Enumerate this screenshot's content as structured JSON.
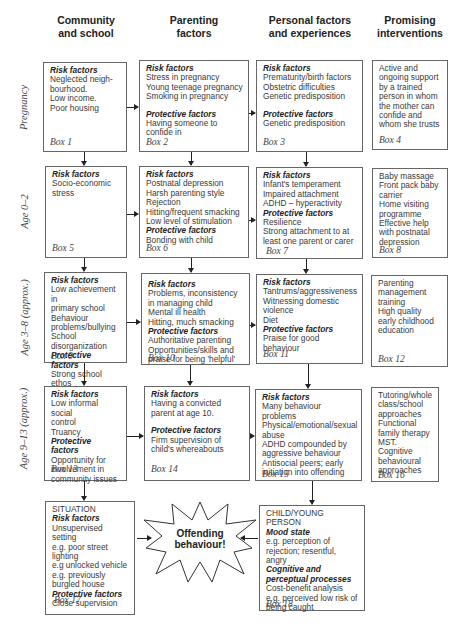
{
  "columns": [
    {
      "title_line1": "Community",
      "title_line2": "and school"
    },
    {
      "title_line1": "Parenting",
      "title_line2": "factors"
    },
    {
      "title_line1": "Personal factors",
      "title_line2": "and experiences"
    },
    {
      "title_line1": "Promising",
      "title_line2": "interventions"
    }
  ],
  "rows": [
    {
      "label": "Pregnancy"
    },
    {
      "label": "Age 0–2"
    },
    {
      "label": "Age 3–8 (approx.)"
    },
    {
      "label": "Age 9–13 (approx.)"
    }
  ],
  "headings": {
    "risk": "Risk factors",
    "protective": "Protective factors"
  },
  "boxes": {
    "b1": {
      "risk": [
        "Neglected neigh-",
        "bourhood.",
        "Low income.",
        "Poor housing"
      ],
      "label": "Box 1"
    },
    "b2": {
      "risk": [
        "Stress in pregnancy",
        "Young teenage pregnancy",
        "Smoking in pregnancy"
      ],
      "protective": [
        "Having someone to",
        "confide in"
      ],
      "label": "Box 2"
    },
    "b3": {
      "risk": [
        "Prematurity/birth factors",
        "Obstetric difficulties",
        "Genetic predisposition"
      ],
      "protective": [
        "Genetic predisposition"
      ],
      "label": "Box 3"
    },
    "b4": {
      "text": [
        "Active and",
        "ongoing support",
        "by a trained",
        "person in whom",
        "the mother can",
        "confide and",
        "whom she trusts"
      ],
      "label": "Box 4"
    },
    "b5": {
      "risk": [
        "Socio-economic",
        "stress"
      ],
      "label": "Box 5"
    },
    "b6": {
      "risk": [
        "Postnatal depression",
        "Harsh parenting style",
        "Rejection",
        "Hitting/frequent smacking",
        "Low level of stimulation"
      ],
      "protective": [
        "Bonding with child"
      ],
      "label": "Box 6"
    },
    "b7": {
      "risk": [
        "Infant's temperament",
        "Impaired attachment",
        "ADHD – hyperactivity"
      ],
      "protective": [
        "Resilience",
        "Strong attachment to at",
        "least one parent or carer"
      ],
      "label": "Box 7"
    },
    "b8": {
      "text": [
        "Baby massage",
        "Front pack baby",
        "carrier",
        "Home visiting",
        "programme",
        "Effective help",
        "with postnatal",
        "depression"
      ],
      "label": "Box 8"
    },
    "b9": {
      "risk": [
        "Low achievement in",
        "primary school",
        "Behaviour",
        "problems/bullying",
        "School",
        "disorganization"
      ],
      "protective": [
        "Strong school ethos"
      ],
      "label": "Box 9"
    },
    "b10": {
      "risk": [
        "Problems, inconsistency",
        "in managing child",
        "Mental ill health",
        "Hitting, much smacking"
      ],
      "protective": [
        "Authoritative parenting",
        "Opportunities/skills and",
        "praise for being 'helpful'"
      ],
      "label": "Box 10"
    },
    "b11": {
      "risk": [
        "Tantrums/aggressiveness",
        "Witnessing domestic",
        "violence",
        "Diet"
      ],
      "protective": [
        "Praise for good behaviour"
      ],
      "label": "Box 11"
    },
    "b12": {
      "text": [
        "Parenting",
        "management",
        "training",
        "High quality",
        "early childhood",
        "education"
      ],
      "label": "Box 12"
    },
    "b13": {
      "risk": [
        "Low informal social",
        "control",
        "Truancy"
      ],
      "protective": [
        "Opportunity for",
        "involvement in",
        "community issues"
      ],
      "label": "Box 13"
    },
    "b14": {
      "risk": [
        "Having a convicted",
        "parent at age 10."
      ],
      "protective": [
        "Firm supervision of",
        "child's whereabouts"
      ],
      "label": "Box 14"
    },
    "b15": {
      "risk": [
        "Many behaviour problems",
        "Physical/emotional/sexual",
        "abuse",
        "ADHD compounded by",
        "aggressive behaviour",
        "Antisocial peers;  early",
        "initiation into offending"
      ],
      "label": "Box 15"
    },
    "b16": {
      "text": [
        "Tutoring/whole",
        "class/school",
        "approaches",
        "Functional",
        "family therapy",
        "MST. Cognitive",
        "behavioural",
        "approaches"
      ],
      "label": "Box 16"
    },
    "b17": {
      "title": "SITUATION",
      "risk": [
        "Unsupervised setting",
        "e.g. poor street",
        "lighting",
        "e.g unlocked vehicle",
        "e.g. previously",
        "burgled house"
      ],
      "protective": [
        "Close supervision"
      ],
      "label": "Box 17"
    },
    "b18": {
      "title": "CHILD/YOUNG PERSON",
      "h1": "Mood state",
      "t1": [
        "e.g. perception of",
        "rejection;  resentful, angry"
      ],
      "h2a": "Cognitive and",
      "h2b": "perceptual processes",
      "t2": [
        "Cost-benefit analysis",
        "e.g.  perceived low risk of",
        "being caught"
      ],
      "label": "Box 18"
    }
  },
  "burst": {
    "line1": "Offending",
    "line2": "behaviour!"
  },
  "colors": {
    "border": "#666666",
    "arrow": "#222222",
    "text": "#3a3a3a"
  }
}
